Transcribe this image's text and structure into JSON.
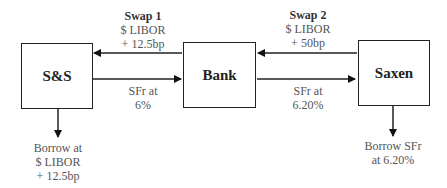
{
  "nodes": {
    "ss": {
      "label": "S&S"
    },
    "bank": {
      "label": "Bank"
    },
    "saxen": {
      "label": "Saxen"
    }
  },
  "edges": {
    "swap1": {
      "title": "Swap 1",
      "line1": "$ LIBOR",
      "line2": "+ 12.5bp",
      "direction": "bank-to-ss"
    },
    "swap1_return": {
      "line1": "SFr at",
      "line2": "6%",
      "direction": "ss-to-bank"
    },
    "swap2": {
      "title": "Swap 2",
      "line1": "$ LIBOR",
      "line2": "+ 50bp",
      "direction": "saxen-to-bank"
    },
    "swap2_return": {
      "line1": "SFr at",
      "line2": "6.20%",
      "direction": "bank-to-saxen"
    },
    "ss_borrow": {
      "line1": "Borrow at",
      "line2": "$ LIBOR",
      "line3": "+ 12.5bp"
    },
    "saxen_borrow": {
      "line1": "Borrow SFr",
      "line2": "at 6.20%"
    }
  }
}
